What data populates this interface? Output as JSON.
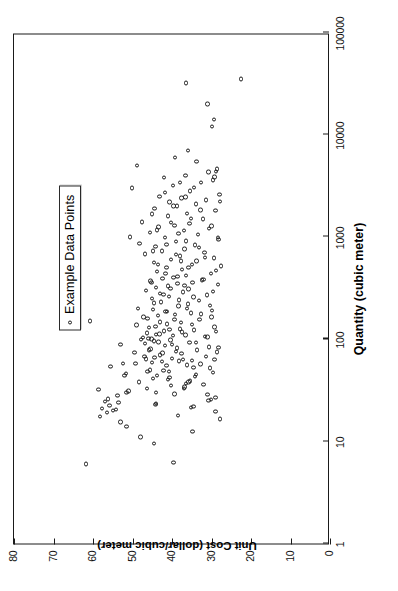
{
  "chart_data": {
    "type": "scatter",
    "title": "",
    "xlabel": "Quantity (cubic meter)",
    "ylabel": "Unit Cost (dollar/cubic meter)",
    "x_scale": "log",
    "y_scale": "linear",
    "xlim": [
      1,
      100000
    ],
    "ylim": [
      0,
      80
    ],
    "x_ticks": [
      1,
      10,
      100,
      1000,
      10000,
      100000
    ],
    "x_tick_labels": [
      "1",
      "10",
      "100",
      "1000",
      "10000",
      "100000"
    ],
    "y_ticks": [
      0,
      10,
      20,
      30,
      40,
      50,
      60,
      70,
      80
    ],
    "y_tick_labels": [
      "0",
      "10",
      "20",
      "30",
      "40",
      "50",
      "60",
      "70",
      "80"
    ],
    "grid": false,
    "legend_position": "upper right",
    "marker": "open-circle",
    "marker_color": "#1b1b1b",
    "series": [
      {
        "name": "Example Data Points",
        "points": [
          [
            6.0,
            61.8
          ],
          [
            6.2,
            39.6
          ],
          [
            9.5,
            44.5
          ],
          [
            11.0,
            48.0
          ],
          [
            12.5,
            34.8
          ],
          [
            14.0,
            51.5
          ],
          [
            15.5,
            53.0
          ],
          [
            16.5,
            27.8
          ],
          [
            17.5,
            58.2
          ],
          [
            18.0,
            38.5
          ],
          [
            19.0,
            56.5
          ],
          [
            19.5,
            29.0
          ],
          [
            20.0,
            55.0
          ],
          [
            20.5,
            54.2
          ],
          [
            21.0,
            57.8
          ],
          [
            21.5,
            35.2
          ],
          [
            22.0,
            34.6
          ],
          [
            22.5,
            55.8
          ],
          [
            23.0,
            44.2
          ],
          [
            23.5,
            44.0
          ],
          [
            24.0,
            53.5
          ],
          [
            24.5,
            57.0
          ],
          [
            25.0,
            30.8
          ],
          [
            25.5,
            30.2
          ],
          [
            26.0,
            56.2
          ],
          [
            27.0,
            29.0
          ],
          [
            28.0,
            53.8
          ],
          [
            28.5,
            31.0
          ],
          [
            29.0,
            39.4
          ],
          [
            30.0,
            51.5
          ],
          [
            31.0,
            51.0
          ],
          [
            32.0,
            58.6
          ],
          [
            33.0,
            37.0
          ],
          [
            34.0,
            36.8
          ],
          [
            35.0,
            40.2
          ],
          [
            36.0,
            32.0
          ],
          [
            37.0,
            36.4
          ],
          [
            38.0,
            35.8
          ],
          [
            39.0,
            35.4
          ],
          [
            40.0,
            41.0
          ],
          [
            41.0,
            44.8
          ],
          [
            42.0,
            40.6
          ],
          [
            43.0,
            34.2
          ],
          [
            44.0,
            43.8
          ],
          [
            45.0,
            34.0
          ],
          [
            46.0,
            51.6
          ],
          [
            47.0,
            29.6
          ],
          [
            48.0,
            46.2
          ],
          [
            49.0,
            42.2
          ],
          [
            50.0,
            45.6
          ],
          [
            52.0,
            30.4
          ],
          [
            54.0,
            55.6
          ],
          [
            55.0,
            41.4
          ],
          [
            56.0,
            36.2
          ],
          [
            57.0,
            32.8
          ],
          [
            58.0,
            52.4
          ],
          [
            59.0,
            45.0
          ],
          [
            60.0,
            42.6
          ],
          [
            61.0,
            38.2
          ],
          [
            62.0,
            35.0
          ],
          [
            63.0,
            29.2
          ],
          [
            64.0,
            46.6
          ],
          [
            65.0,
            40.0
          ],
          [
            66.0,
            44.4
          ],
          [
            68.0,
            47.0
          ],
          [
            70.0,
            43.0
          ],
          [
            72.0,
            37.6
          ],
          [
            74.0,
            49.5
          ],
          [
            75.0,
            28.6
          ],
          [
            76.0,
            39.0
          ],
          [
            78.0,
            33.6
          ],
          [
            80.0,
            45.4
          ],
          [
            82.0,
            38.8
          ],
          [
            84.0,
            30.6
          ],
          [
            86.0,
            41.8
          ],
          [
            88.0,
            53.0
          ],
          [
            90.0,
            46.8
          ],
          [
            92.0,
            35.6
          ],
          [
            94.0,
            43.4
          ],
          [
            96.0,
            44.6
          ],
          [
            98.0,
            40.4
          ],
          [
            100.0,
            45.2
          ],
          [
            102.0,
            46.0
          ],
          [
            104.0,
            47.4
          ],
          [
            106.0,
            31.6
          ],
          [
            108.0,
            39.8
          ],
          [
            110.0,
            36.6
          ],
          [
            112.0,
            43.2
          ],
          [
            115.0,
            46.4
          ],
          [
            118.0,
            28.8
          ],
          [
            120.0,
            42.0
          ],
          [
            123.0,
            34.4
          ],
          [
            126.0,
            38.0
          ],
          [
            130.0,
            45.8
          ],
          [
            133.0,
            44.2
          ],
          [
            137.0,
            49.0
          ],
          [
            140.0,
            41.2
          ],
          [
            145.0,
            37.8
          ],
          [
            150.0,
            60.8
          ],
          [
            155.0,
            33.0
          ],
          [
            160.0,
            46.2
          ],
          [
            165.0,
            30.0
          ],
          [
            170.0,
            43.6
          ],
          [
            175.0,
            39.2
          ],
          [
            180.0,
            35.2
          ],
          [
            185.0,
            41.6
          ],
          [
            190.0,
            29.8
          ],
          [
            195.0,
            44.8
          ],
          [
            200.0,
            48.6
          ],
          [
            210.0,
            38.4
          ],
          [
            220.0,
            36.0
          ],
          [
            230.0,
            42.8
          ],
          [
            240.0,
            33.2
          ],
          [
            250.0,
            45.0
          ],
          [
            260.0,
            40.8
          ],
          [
            270.0,
            31.2
          ],
          [
            280.0,
            43.0
          ],
          [
            290.0,
            37.2
          ],
          [
            300.0,
            46.6
          ],
          [
            310.0,
            35.8
          ],
          [
            320.0,
            44.0
          ],
          [
            330.0,
            41.0
          ],
          [
            340.0,
            28.4
          ],
          [
            350.0,
            38.6
          ],
          [
            360.0,
            34.8
          ],
          [
            370.0,
            45.4
          ],
          [
            380.0,
            32.4
          ],
          [
            390.0,
            42.4
          ],
          [
            400.0,
            39.6
          ],
          [
            420.0,
            36.4
          ],
          [
            440.0,
            30.2
          ],
          [
            460.0,
            43.8
          ],
          [
            480.0,
            37.4
          ],
          [
            500.0,
            41.4
          ],
          [
            520.0,
            27.6
          ],
          [
            540.0,
            35.0
          ],
          [
            560.0,
            44.6
          ],
          [
            580.0,
            33.8
          ],
          [
            600.0,
            40.2
          ],
          [
            620.0,
            29.4
          ],
          [
            650.0,
            38.0
          ],
          [
            680.0,
            46.8
          ],
          [
            700.0,
            31.8
          ],
          [
            730.0,
            42.6
          ],
          [
            760.0,
            36.8
          ],
          [
            800.0,
            44.2
          ],
          [
            830.0,
            34.2
          ],
          [
            860.0,
            48.2
          ],
          [
            900.0,
            39.0
          ],
          [
            940.0,
            28.2
          ],
          [
            980.0,
            41.8
          ],
          [
            1000.0,
            50.6
          ],
          [
            1050.0,
            33.4
          ],
          [
            1100.0,
            45.6
          ],
          [
            1150.0,
            37.0
          ],
          [
            1200.0,
            30.6
          ],
          [
            1250.0,
            43.4
          ],
          [
            1300.0,
            39.4
          ],
          [
            1350.0,
            35.6
          ],
          [
            1400.0,
            47.6
          ],
          [
            1500.0,
            32.2
          ],
          [
            1600.0,
            41.0
          ],
          [
            1700.0,
            36.2
          ],
          [
            1800.0,
            29.0
          ],
          [
            1900.0,
            44.4
          ],
          [
            2000.0,
            38.8
          ],
          [
            2100.0,
            34.0
          ],
          [
            2200.0,
            40.6
          ],
          [
            2300.0,
            31.4
          ],
          [
            2400.0,
            37.6
          ],
          [
            2500.0,
            43.2
          ],
          [
            2600.0,
            28.0
          ],
          [
            2800.0,
            35.4
          ],
          [
            3000.0,
            50.2
          ],
          [
            3200.0,
            39.8
          ],
          [
            3400.0,
            32.6
          ],
          [
            3600.0,
            29.6
          ],
          [
            3800.0,
            42.0
          ],
          [
            4000.0,
            36.6
          ],
          [
            4300.0,
            30.8
          ],
          [
            4600.0,
            28.6
          ],
          [
            5000.0,
            48.8
          ],
          [
            5500.0,
            33.8
          ],
          [
            6000.0,
            39.2
          ],
          [
            7000.0,
            36.0
          ],
          [
            12000.0,
            29.8
          ],
          [
            14000.0,
            29.4
          ],
          [
            20000.0,
            31.0
          ],
          [
            32000.0,
            36.4
          ],
          [
            35000.0,
            22.6
          ],
          [
            30.0,
            44.0
          ],
          [
            33.0,
            46.4
          ],
          [
            38.0,
            48.4
          ],
          [
            44.0,
            52.0
          ],
          [
            48.0,
            40.8
          ],
          [
            53.0,
            34.6
          ],
          [
            58.0,
            49.2
          ],
          [
            63.0,
            37.2
          ],
          [
            68.0,
            31.4
          ],
          [
            73.0,
            42.4
          ],
          [
            78.0,
            45.8
          ],
          [
            83.0,
            28.2
          ],
          [
            88.0,
            40.0
          ],
          [
            93.0,
            34.0
          ],
          [
            99.0,
            47.8
          ],
          [
            105.0,
            31.0
          ],
          [
            111.0,
            44.0
          ],
          [
            117.0,
            37.4
          ],
          [
            124.0,
            40.6
          ],
          [
            131.0,
            29.2
          ],
          [
            139.0,
            35.0
          ],
          [
            147.0,
            43.0
          ],
          [
            156.0,
            39.4
          ],
          [
            165.0,
            47.2
          ],
          [
            176.0,
            32.6
          ],
          [
            187.0,
            41.2
          ],
          [
            199.0,
            36.2
          ],
          [
            212.0,
            30.4
          ],
          [
            226.0,
            44.6
          ],
          [
            241.0,
            38.2
          ],
          [
            257.0,
            34.6
          ],
          [
            274.0,
            42.2
          ],
          [
            293.0,
            29.6
          ],
          [
            313.0,
            40.4
          ],
          [
            335.0,
            36.8
          ],
          [
            358.0,
            45.2
          ],
          [
            383.0,
            32.0
          ],
          [
            410.0,
            38.6
          ],
          [
            438.0,
            41.6
          ],
          [
            470.0,
            28.8
          ],
          [
            503.0,
            35.8
          ],
          [
            540.0,
            43.6
          ],
          [
            580.0,
            37.8
          ],
          [
            625.0,
            31.6
          ],
          [
            672.0,
            39.0
          ],
          [
            725.0,
            44.8
          ],
          [
            782.0,
            33.2
          ],
          [
            845.0,
            41.4
          ],
          [
            915.0,
            36.4
          ],
          [
            990.0,
            28.4
          ],
          [
            1075.0,
            38.4
          ],
          [
            1170.0,
            43.8
          ],
          [
            1275.0,
            30.0
          ],
          [
            1390.0,
            40.2
          ],
          [
            1520.0,
            35.2
          ],
          [
            1670.0,
            45.0
          ],
          [
            1830.0,
            32.8
          ],
          [
            2010.0,
            39.6
          ],
          [
            2220.0,
            27.8
          ],
          [
            2450.0,
            36.6
          ],
          [
            2720.0,
            41.8
          ],
          [
            3050.0,
            34.4
          ],
          [
            3420.0,
            38.0
          ],
          [
            3850.0,
            29.2
          ],
          [
            4350.0,
            28.8
          ]
        ]
      }
    ]
  },
  "legend": {
    "marker_icon": "open-circle-marker",
    "label": "Example Data Points"
  },
  "axes": {
    "x_title": "Quantity (cubic meter)",
    "y_title": "Unit Cost (dollar/cubic meter)"
  }
}
